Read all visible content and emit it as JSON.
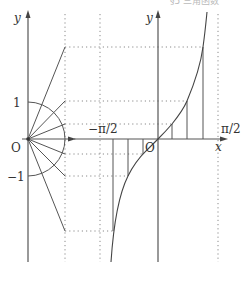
{
  "header": {
    "cropped_text": "§5 三角函数"
  },
  "diagram": {
    "left_panel": {
      "y_axis_label": "y",
      "origin_label": "O",
      "tick_one_label": "1",
      "tick_neg_one_label": "−1",
      "unit_circle_radius_px": 37
    },
    "right_panel": {
      "y_axis_label": "y",
      "x_axis_label": "x",
      "origin_label": "O",
      "neg_half_pi_label": "−π/2",
      "pos_half_pi_label": "π/2"
    },
    "colors": {
      "line": "#555555",
      "dotted": "#8a8a8a",
      "text": "#333333"
    }
  }
}
